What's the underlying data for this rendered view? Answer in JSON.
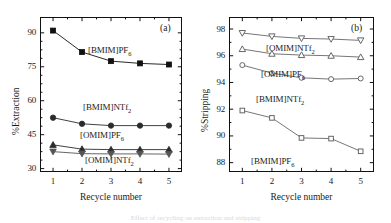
{
  "figure": {
    "caption_fragment": "Effect of recycling on extraction and stripping"
  },
  "panels": [
    {
      "tag": "(a)",
      "xlabel": "Recycle number",
      "ylabel": "%Extraction",
      "xticks": [
        "1",
        "2",
        "3",
        "4",
        "5"
      ],
      "yticks": [
        "30",
        "45",
        "60",
        "75",
        "90"
      ],
      "labels": [
        {
          "text": "[BMIM]PF",
          "sub": "6"
        },
        {
          "text": "[BMIM]NTf",
          "sub": "2"
        },
        {
          "text": "[OMIM]PF",
          "sub": "6"
        },
        {
          "text": "[OMIM]NTf",
          "sub": "2"
        }
      ]
    },
    {
      "tag": "(b)",
      "xlabel": "Recycle number",
      "ylabel": "%Stripping",
      "xticks": [
        "1",
        "2",
        "3",
        "4",
        "5"
      ],
      "yticks": [
        "88",
        "90",
        "92",
        "94",
        "96",
        "98"
      ],
      "labels": [
        {
          "text": "[OMIM]NTf",
          "sub": "2"
        },
        {
          "text": "[OMIM]PF",
          "sub": "6"
        },
        {
          "text": "[BMIM]NTf",
          "sub": "2"
        },
        {
          "text": "[BMIM]PF",
          "sub": "6"
        }
      ]
    }
  ],
  "chart_data": [
    {
      "type": "line",
      "panel": "(a)",
      "title": "(a)",
      "xlabel": "Recycle number",
      "ylabel": "%Extraction",
      "x": [
        1,
        2,
        3,
        4,
        5
      ],
      "xlim": [
        0.55,
        5.45
      ],
      "ylim": [
        28.5,
        97.0
      ],
      "xticks": [
        1,
        2,
        3,
        4,
        5
      ],
      "yticks": [
        30,
        45,
        60,
        75,
        90
      ],
      "grid": false,
      "legend": "inline-annotations",
      "series": [
        {
          "name": "[BMIM]PF6",
          "marker": "filled-square",
          "color": "#111111",
          "values": [
            91.0,
            81.5,
            77.5,
            76.5,
            76.0
          ]
        },
        {
          "name": "[BMIM]NTf2",
          "marker": "filled-circle",
          "color": "#2b2b2b",
          "values": [
            52.5,
            49.8,
            49.0,
            49.0,
            49.0
          ]
        },
        {
          "name": "[OMIM]PF6",
          "marker": "filled-up-triangle",
          "color": "#2b2b2b",
          "values": [
            40.5,
            38.6,
            38.4,
            38.4,
            38.4
          ]
        },
        {
          "name": "[OMIM]NTf2",
          "marker": "filled-down-triangle",
          "color": "#555555",
          "values": [
            37.5,
            36.6,
            36.5,
            36.5,
            36.4
          ]
        }
      ]
    },
    {
      "type": "line",
      "panel": "(b)",
      "title": "(b)",
      "xlabel": "Recycle number",
      "ylabel": "%Stripping",
      "x": [
        1,
        2,
        3,
        4,
        5
      ],
      "xlim": [
        0.55,
        5.45
      ],
      "ylim": [
        87.3,
        98.9
      ],
      "xticks": [
        1,
        2,
        3,
        4,
        5
      ],
      "yticks": [
        88,
        90,
        92,
        94,
        96,
        98
      ],
      "grid": false,
      "legend": "inline-annotations",
      "series": [
        {
          "name": "[OMIM]NTf2",
          "marker": "open-down-triangle",
          "color": "#666666",
          "values": [
            97.7,
            97.45,
            97.3,
            97.25,
            97.15
          ]
        },
        {
          "name": "[OMIM]PF6",
          "marker": "open-up-triangle",
          "color": "#666666",
          "values": [
            96.5,
            96.15,
            96.05,
            96.0,
            95.9
          ]
        },
        {
          "name": "[BMIM]NTf2",
          "marker": "open-circle",
          "color": "#666666",
          "values": [
            95.3,
            94.7,
            94.35,
            94.25,
            94.3
          ]
        },
        {
          "name": "[BMIM]PF6",
          "marker": "open-square",
          "color": "#666666",
          "values": [
            91.9,
            91.35,
            89.85,
            89.8,
            88.85
          ]
        }
      ]
    }
  ]
}
